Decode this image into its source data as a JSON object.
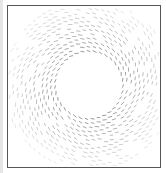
{
  "figure": {
    "type": "vector-field-around-circular-obstacle",
    "frame": {
      "x": 7,
      "y": 5,
      "width": 152,
      "height": 161,
      "border_color": "#555555"
    },
    "obstacle": {
      "shape": "circle",
      "cx": 81,
      "cy": 79,
      "r": 32,
      "fill": "#ffffff"
    },
    "field": {
      "pattern": "tangential-swirl",
      "inner_radius": 33,
      "outer_radius": 88,
      "ring_spacing": 4.2,
      "dash_length": 3.2,
      "dash_width": 0.7,
      "dash_color": "#555555",
      "swirl_angle_deg": 18,
      "opacity_near": 0.85,
      "opacity_far": 0.15
    }
  }
}
